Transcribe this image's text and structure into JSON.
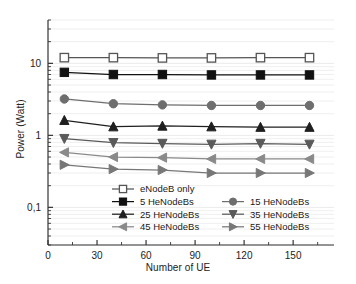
{
  "chart_data": {
    "type": "line",
    "title": "",
    "xlabel": "Number of UE",
    "ylabel": "Power (Watt)",
    "xlim": [
      0,
      175
    ],
    "ylim": [
      0.03,
      40
    ],
    "yscale": "log",
    "grid": true,
    "legend_position": "inside-bottom-center",
    "x": [
      10,
      40,
      70,
      100,
      130,
      160
    ],
    "xticks": [
      "0",
      "30",
      "60",
      "90",
      "120",
      "150"
    ],
    "xtick_values": [
      0,
      30,
      60,
      90,
      120,
      150
    ],
    "yticks": [
      "10",
      "1",
      "0,1"
    ],
    "ytick_values": [
      10,
      1,
      0.1
    ],
    "series": [
      {
        "name": "eNodeB only",
        "marker": "square-open",
        "color": "#555555",
        "values": [
          12.0,
          12.0,
          11.9,
          11.9,
          12.0,
          12.0
        ]
      },
      {
        "name": "5 HeNodeBs",
        "marker": "square-filled",
        "color": "#111111",
        "values": [
          7.5,
          7.0,
          7.0,
          6.9,
          6.9,
          6.9
        ]
      },
      {
        "name": "15 HeNodeBs",
        "marker": "circle-filled",
        "color": "#6e6e6e",
        "values": [
          3.2,
          2.75,
          2.65,
          2.6,
          2.6,
          2.6
        ]
      },
      {
        "name": "25 HeNodeBs",
        "marker": "triangle-up-filled",
        "color": "#1f1f1f",
        "values": [
          1.62,
          1.32,
          1.35,
          1.32,
          1.3,
          1.3
        ]
      },
      {
        "name": "35 HeNodeBs",
        "marker": "triangle-down-filled",
        "color": "#5a5a5a",
        "values": [
          0.9,
          0.79,
          0.77,
          0.75,
          0.77,
          0.75
        ]
      },
      {
        "name": "45 HeNodeBs",
        "marker": "triangle-left-filled",
        "color": "#8a8a8a",
        "values": [
          0.58,
          0.5,
          0.49,
          0.47,
          0.47,
          0.47
        ]
      },
      {
        "name": "55 HeNodeBs",
        "marker": "triangle-right-filled",
        "color": "#777777",
        "values": [
          0.39,
          0.34,
          0.33,
          0.3,
          0.3,
          0.3
        ]
      }
    ]
  },
  "axes": {
    "x_title": "Number of UE",
    "y_title": "Power (Watt)"
  },
  "legend": {
    "items": [
      {
        "label": "eNodeB only"
      },
      {
        "label": "5 HeNodeBs"
      },
      {
        "label": "15 HeNodeBs"
      },
      {
        "label": "25 HeNodeBs"
      },
      {
        "label": "35 HeNodeBs"
      },
      {
        "label": "45 HeNodeBs"
      },
      {
        "label": "55 HeNodeBs"
      }
    ]
  },
  "colors": {
    "frame": "#333333",
    "grid": "#e8e8e8",
    "background": "#ffffff"
  }
}
